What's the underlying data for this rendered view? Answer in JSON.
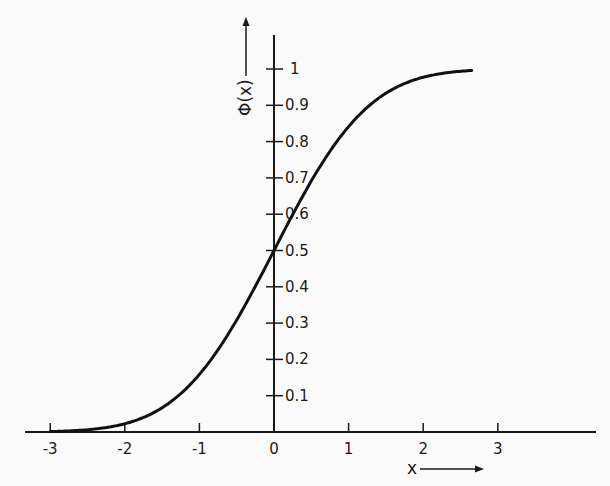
{
  "chart_data": {
    "type": "line",
    "title": "",
    "xlabel": "x",
    "ylabel": "Φ(x)",
    "function": "standard normal cumulative distribution function",
    "xlim": [
      -3.3,
      4.4
    ],
    "ylim": [
      0,
      1
    ],
    "x_ticks": [
      -3,
      -2,
      -1,
      0,
      1,
      2,
      3
    ],
    "x_tick_labels": [
      "-3",
      "-2",
      "-1",
      "0",
      "1",
      "2",
      "3"
    ],
    "y_ticks": [
      0.1,
      0.2,
      0.3,
      0.4,
      0.5,
      0.6,
      0.7,
      0.8,
      0.9,
      1.0
    ],
    "y_tick_labels": [
      "0.1",
      "0.2",
      "0.3",
      "0.4",
      "0.5",
      "0.6",
      "0.7",
      "0.8",
      "0.9",
      "1"
    ],
    "grid": false,
    "legend": null,
    "series": [
      {
        "name": "Φ(x)",
        "x": [
          -3.0,
          -2.5,
          -2.0,
          -1.5,
          -1.0,
          -0.5,
          0.0,
          0.5,
          1.0,
          1.5,
          2.0,
          2.5,
          2.65
        ],
        "values": [
          0.001,
          0.006,
          0.023,
          0.067,
          0.159,
          0.309,
          0.5,
          0.691,
          0.841,
          0.933,
          0.977,
          0.994,
          0.996
        ]
      }
    ],
    "x_range_plotted": [
      -3.0,
      2.65
    ],
    "color": "#111111"
  }
}
